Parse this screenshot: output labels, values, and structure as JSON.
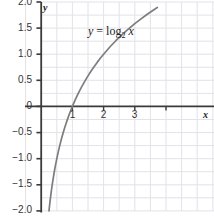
{
  "chart_data": {
    "type": "line",
    "title": "",
    "subtitle": "",
    "xlabel": "x",
    "ylabel": "y",
    "xlim": [
      -0.45,
      3.72
    ],
    "ylim": [
      -2.0,
      2.0
    ],
    "grid": true,
    "grid_x_step": 0.5,
    "grid_y_step": 0.25,
    "legend": "none",
    "annotations": [
      {
        "name": "function-equation",
        "text": "y = log2 x",
        "lhs": "y",
        "operator": "=",
        "function": "log",
        "base": "2",
        "argument": "x",
        "x": 1.45,
        "y": 1.55
      }
    ],
    "xticks": [
      1,
      2,
      3
    ],
    "xtick_labels": [
      "1",
      "2",
      "3"
    ],
    "yticks": [
      -2.0,
      -1.5,
      -1.0,
      -0.5,
      0,
      0.5,
      1.0,
      1.5,
      2.0
    ],
    "ytick_labels": [
      "−2.0",
      "−1.5",
      "−1.0",
      "−0.5",
      "0",
      "0.5",
      "1.0",
      "1.5",
      "2.0"
    ],
    "series": [
      {
        "name": "y = log2 x",
        "color": "#7d7d7d",
        "x": [
          0.25,
          0.27,
          0.29,
          0.32,
          0.35,
          0.38,
          0.42,
          0.46,
          0.5,
          0.55,
          0.6,
          0.65,
          0.7,
          0.75,
          0.8,
          0.85,
          0.9,
          0.95,
          1.0,
          1.1,
          1.2,
          1.3,
          1.4,
          1.5,
          1.6,
          1.7,
          1.8,
          1.9,
          2.0,
          2.2,
          2.4,
          2.6,
          2.8,
          3.0,
          3.2,
          3.4,
          3.6,
          3.72
        ],
        "y": [
          -2.0,
          -1.889,
          -1.786,
          -1.644,
          -1.515,
          -1.396,
          -1.252,
          -1.12,
          -1.0,
          -0.862,
          -0.737,
          -0.621,
          -0.515,
          -0.415,
          -0.322,
          -0.234,
          -0.152,
          -0.074,
          0.0,
          0.138,
          0.263,
          0.379,
          0.485,
          0.585,
          0.678,
          0.766,
          0.848,
          0.926,
          1.0,
          1.138,
          1.263,
          1.379,
          1.485,
          1.585,
          1.678,
          1.766,
          1.848,
          1.895
        ]
      }
    ],
    "colors": {
      "curve": "#7d7d7d",
      "axis": "#3a3a3a",
      "grid": "#e2e2e8",
      "text": "#333333",
      "background": "#ffffff"
    }
  }
}
